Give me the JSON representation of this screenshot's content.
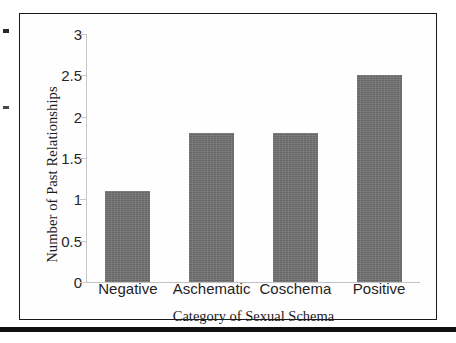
{
  "chart_data": {
    "type": "bar",
    "title": "",
    "subtitle": "",
    "xlabel": "Category of Sexual Schema",
    "ylabel": "Number of Past Relationships",
    "categories": [
      "Negative",
      "Aschematic",
      "Coschema",
      "Positive"
    ],
    "values": [
      1.1,
      1.8,
      1.8,
      2.5
    ],
    "ylim": [
      0,
      3
    ],
    "yticks": [
      "0",
      "0.5",
      "1",
      "1.5",
      "2",
      "2.5",
      "3"
    ],
    "ytick_values": [
      0,
      0.5,
      1,
      1.5,
      2,
      2.5,
      3
    ],
    "grid": false,
    "legend": null,
    "legend_position": "none",
    "bar_color": "#6f6f6f",
    "axis_color": "#c9c9c9",
    "text_color": "#1c1c1c",
    "frame_color": "#1a1a1a"
  },
  "figure": {
    "border_color": "#1a1a1a",
    "background": "#fefefe"
  },
  "page": {
    "rule_color": "#111111"
  }
}
